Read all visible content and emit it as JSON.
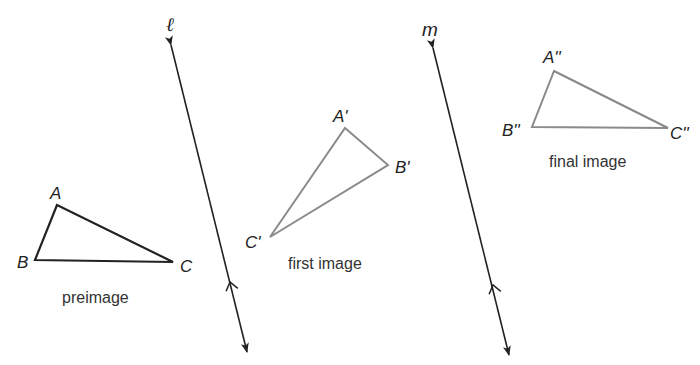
{
  "diagram": {
    "type": "reflection-composition",
    "colors": {
      "background": "#ffffff",
      "dark_stroke": "#222222",
      "image_stroke": "#8a8a8a",
      "text": "#222222"
    },
    "lines": [
      {
        "name": "l",
        "label": "ℓ",
        "label_pos": [
          166,
          31
        ],
        "top": [
          171,
          45
        ],
        "bottom": [
          247,
          352
        ],
        "chevron_at": [
          230,
          282
        ]
      },
      {
        "name": "m",
        "label": "m",
        "label_pos": [
          422,
          36
        ],
        "top": [
          433,
          48
        ],
        "bottom": [
          509,
          355
        ],
        "chevron_at": [
          493,
          285
        ]
      }
    ],
    "triangles": [
      {
        "name": "preimage",
        "caption": "preimage",
        "caption_pos": [
          62,
          303
        ],
        "stroke": "dark",
        "vertices": {
          "A": {
            "label": "A",
            "pt": [
              57,
              205
            ],
            "label_pos": [
              50,
              199
            ]
          },
          "B": {
            "label": "B",
            "pt": [
              35,
              260
            ],
            "label_pos": [
              17,
              268
            ]
          },
          "C": {
            "label": "C",
            "pt": [
              173,
              262
            ],
            "label_pos": [
              180,
              272
            ]
          }
        }
      },
      {
        "name": "first-image",
        "caption": "first image",
        "caption_pos": [
          288,
          269
        ],
        "stroke": "gray",
        "vertices": {
          "A": {
            "label": "A'",
            "pt": [
              345,
              128
            ],
            "label_pos": [
              333,
              122
            ]
          },
          "B": {
            "label": "B'",
            "pt": [
              388,
              165
            ],
            "label_pos": [
              395,
              173
            ]
          },
          "C": {
            "label": "C'",
            "pt": [
              270,
              237
            ],
            "label_pos": [
              245,
              248
            ]
          }
        }
      },
      {
        "name": "final-image",
        "caption": "final image",
        "caption_pos": [
          549,
          167
        ],
        "stroke": "gray",
        "vertices": {
          "A": {
            "label": "A''",
            "pt": [
              554,
              71
            ],
            "label_pos": [
              543,
              63
            ]
          },
          "B": {
            "label": "B''",
            "pt": [
              532,
              127
            ],
            "label_pos": [
              502,
              136
            ]
          },
          "C": {
            "label": "C''",
            "pt": [
              668,
              128
            ],
            "label_pos": [
              670,
              139
            ]
          }
        }
      }
    ]
  }
}
